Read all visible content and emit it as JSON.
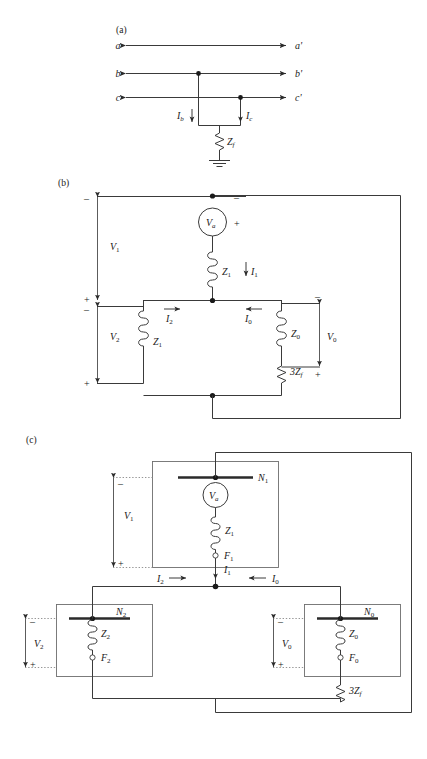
{
  "figure": {
    "parts": {
      "a": "(a)",
      "b": "(b)",
      "c": "(c)"
    }
  },
  "part_a": {
    "caption": "(a)",
    "phase_labels_left": [
      "a",
      "b",
      "c"
    ],
    "phase_labels_right": [
      "a'",
      "b'",
      "c'"
    ],
    "currents": [
      {
        "name": "I",
        "sub": "b",
        "direction": "down"
      },
      {
        "name": "I",
        "sub": "c",
        "direction": "down"
      }
    ],
    "fault_impedance": {
      "name": "Z",
      "sub": "f"
    },
    "ground": "ground-symbol"
  },
  "part_b": {
    "caption": "(b)",
    "source": {
      "name": "V",
      "sub": "a",
      "polarity_top": "–",
      "polarity_bottom": "+"
    },
    "impedances": [
      {
        "name": "Z",
        "sub": "1",
        "branch": "positive-sequence-series"
      },
      {
        "name": "Z",
        "sub": "1",
        "branch": "negative-sequence"
      },
      {
        "name": "Z",
        "sub": "0",
        "branch": "zero-sequence"
      },
      {
        "name": "3Z",
        "sub": "f",
        "branch": "fault"
      }
    ],
    "voltages": [
      {
        "name": "V",
        "sub": "1",
        "plus": "+",
        "minus": "–"
      },
      {
        "name": "V",
        "sub": "2",
        "plus": "+",
        "minus": "–"
      },
      {
        "name": "V",
        "sub": "0",
        "plus": "+",
        "minus": "–"
      }
    ],
    "currents": [
      {
        "name": "I",
        "sub": "1",
        "direction": "down"
      },
      {
        "name": "I",
        "sub": "2",
        "direction": "right"
      },
      {
        "name": "I",
        "sub": "0",
        "direction": "left"
      }
    ]
  },
  "part_c": {
    "caption": "(c)",
    "networks": [
      {
        "bus": {
          "name": "N",
          "sub": "1"
        },
        "terminal": {
          "name": "F",
          "sub": "1"
        },
        "impedance": {
          "name": "Z",
          "sub": "1"
        },
        "voltage": {
          "name": "V",
          "sub": "1",
          "plus": "+",
          "minus": "–"
        },
        "source": {
          "name": "V",
          "sub": "a"
        }
      },
      {
        "bus": {
          "name": "N",
          "sub": "2"
        },
        "terminal": {
          "name": "F",
          "sub": "2"
        },
        "impedance": {
          "name": "Z",
          "sub": "2"
        },
        "voltage": {
          "name": "V",
          "sub": "2",
          "plus": "+",
          "minus": "–"
        }
      },
      {
        "bus": {
          "name": "N",
          "sub": "0"
        },
        "terminal": {
          "name": "F",
          "sub": "0"
        },
        "impedance": {
          "name": "Z",
          "sub": "0"
        },
        "voltage": {
          "name": "V",
          "sub": "0",
          "plus": "+",
          "minus": "–"
        }
      }
    ],
    "fault_impedance": {
      "name": "3Z",
      "sub": "f"
    },
    "currents": [
      {
        "name": "I",
        "sub": "1",
        "direction": "down"
      },
      {
        "name": "I",
        "sub": "2",
        "direction": "right"
      },
      {
        "name": "I",
        "sub": "0",
        "direction": "left"
      }
    ]
  },
  "colors": {
    "wire": "#3a3a3a",
    "box": "#6e6e6e",
    "bus": "#2a2a2a",
    "dotted": "#8a8a8a",
    "text": "#1a1a1a",
    "background": "#ffffff"
  }
}
